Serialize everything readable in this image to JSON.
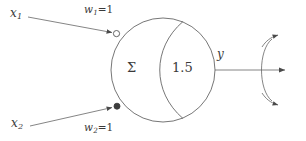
{
  "figure": {
    "type": "neuron-threshold-unit-diagram",
    "background_color": "#ffffff",
    "stroke_color": "#555555",
    "text_color": "#3a3a3a"
  },
  "inputs": [
    {
      "id": "x1",
      "name": "x",
      "subscript": "1",
      "weight_name": "w",
      "weight_subscript": "1",
      "weight_equals": "=",
      "weight_value": "1",
      "weight_label": "w1=1",
      "terminator": "open-circle",
      "position": "top"
    },
    {
      "id": "x2",
      "name": "x",
      "subscript": "2",
      "weight_name": "w",
      "weight_subscript": "2",
      "weight_equals": "=",
      "weight_value": "1",
      "weight_label": "w2=1",
      "terminator": "filled-circle",
      "position": "bottom"
    }
  ],
  "body": {
    "summation_symbol": "Σ",
    "threshold_value": "1.5"
  },
  "output": {
    "name": "y",
    "fanout_count": "3"
  }
}
